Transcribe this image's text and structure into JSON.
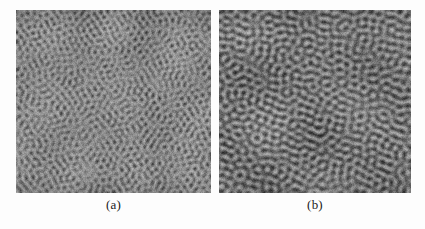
{
  "figure": {
    "background_color": "#fdfdfd",
    "caption_color": "#1b1b1b",
    "panels": [
      {
        "id": "a",
        "label": "(a)",
        "name": "micrograph-panel-a",
        "morphology": "droplet",
        "description": "Grayscale micrograph showing isolated bright droplet-like islands dispersed on a dark matrix",
        "x": 16,
        "y": 10,
        "width": 195,
        "height": 183,
        "mean_gray": "#4f4f4f",
        "bright_gray": "#bdbdbd",
        "dark_gray": "#2e2e2e",
        "feature_scale_px": 6.0,
        "feature_anisotropy": 1.0,
        "threshold": 0.38,
        "seed": 20513
      },
      {
        "id": "b",
        "label": "(b)",
        "name": "micrograph-panel-b",
        "morphology": "stripe",
        "description": "Grayscale micrograph showing elongated labyrinthine worm-like stripe domains",
        "x": 219,
        "y": 10,
        "width": 192,
        "height": 183,
        "mean_gray": "#565656",
        "bright_gray": "#c2c2c2",
        "dark_gray": "#323232",
        "feature_scale_px": 7.5,
        "feature_anisotropy": 1.0,
        "threshold": 0.5,
        "seed": 77321
      }
    ]
  }
}
